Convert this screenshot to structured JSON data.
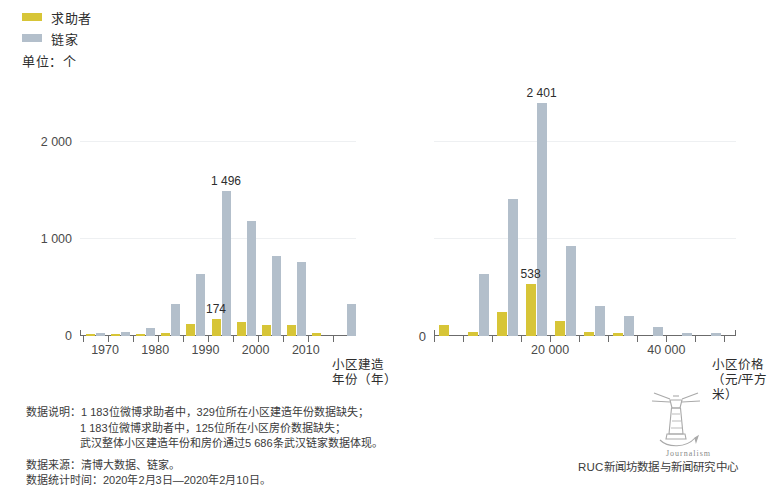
{
  "legend": {
    "items": [
      {
        "label": "求助者",
        "color": "#d7c537",
        "key": "seeker"
      },
      {
        "label": "链家",
        "color": "#b3bfcb",
        "key": "lianjia"
      }
    ],
    "unit": "单位：个"
  },
  "chart_data": [
    {
      "id": "build-year",
      "type": "bar",
      "title": "",
      "xlabel": "小区建造年份（年）",
      "ylabel": "",
      "ylim": [
        0,
        2500
      ],
      "yticks": [
        0,
        1000,
        2000
      ],
      "ytick_labels": [
        "0",
        "1 000",
        "2 000"
      ],
      "xlim": [
        1965,
        2020
      ],
      "xticks": [
        1970,
        1980,
        1990,
        2000,
        2010
      ],
      "xtick_labels": [
        "1970",
        "1980",
        "1990",
        "2000",
        "2010"
      ],
      "grid": true,
      "categories": [
        1968,
        1973,
        1978,
        1983,
        1988,
        1993,
        1998,
        2003,
        2008,
        2013,
        2018
      ],
      "series": [
        {
          "name": "求助者",
          "color": "#d7c537",
          "values": [
            4,
            6,
            16,
            36,
            120,
            174,
            142,
            116,
            112,
            26,
            0
          ]
        },
        {
          "name": "链家",
          "color": "#b3bfcb",
          "values": [
            34,
            46,
            78,
            330,
            640,
            1496,
            1180,
            820,
            760,
            0,
            330
          ]
        }
      ],
      "annotations": [
        {
          "text": "1 496",
          "series": "链家",
          "category_index": 5,
          "value": 1496
        },
        {
          "text": "174",
          "series": "求助者",
          "category_index": 5,
          "value": 174
        }
      ]
    },
    {
      "id": "house-price",
      "type": "bar",
      "title": "",
      "xlabel": "小区价格（元/平方米）",
      "ylabel": "",
      "ylim": [
        0,
        2500
      ],
      "yticks": [
        0,
        1000,
        2000
      ],
      "ytick_labels": [
        "0",
        "1 000",
        "2 000"
      ],
      "xlim": [
        0,
        52000
      ],
      "xticks": [
        20000,
        40000
      ],
      "xtick_labels": [
        "20 000",
        "40 000"
      ],
      "grid": true,
      "categories": [
        2500,
        7500,
        12500,
        17500,
        22500,
        27500,
        32500,
        37500,
        42500,
        47500
      ],
      "series": [
        {
          "name": "求助者",
          "color": "#d7c537",
          "values": [
            118,
            46,
            250,
            538,
            150,
            40,
            34,
            0,
            0,
            0
          ]
        },
        {
          "name": "链家",
          "color": "#b3bfcb",
          "values": [
            0,
            640,
            1410,
            2401,
            930,
            310,
            210,
            90,
            26,
            30
          ]
        }
      ],
      "annotations": [
        {
          "text": "2 401",
          "series": "链家",
          "category_index": 3,
          "value": 2401
        },
        {
          "text": "538",
          "series": "求助者",
          "category_index": 3,
          "value": 538
        }
      ]
    }
  ],
  "notes": {
    "block1": {
      "label": "数据说明：",
      "lines": [
        "1 183位微博求助者中，329位所在小区建造年份数据缺失；",
        "1 183位微博求助者中，125位所在小区房价数据缺失；",
        "武汉整体小区建造年份和房价通过5 686条武汉链家数据体现。"
      ]
    },
    "source": "数据来源：清博大数据、链家。",
    "period": "数据统计时间：2020年2月3日—2020年2月10日。"
  },
  "credit": {
    "org": "RUC新闻坊数据与新闻研究中心",
    "logo_word": "Journalism"
  }
}
